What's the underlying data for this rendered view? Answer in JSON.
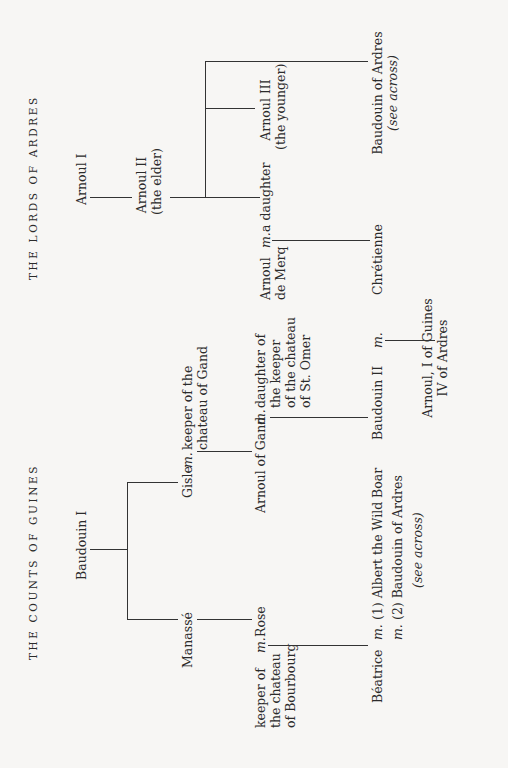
{
  "titles": {
    "lords": "THE LORDS OF ARDRES",
    "counts": "THE COUNTS OF GUINES"
  },
  "marriage_symbol": "m.",
  "lords_of_ardres": {
    "arnoul1": "Arnoul I",
    "arnoul2": {
      "name": "Arnoul II",
      "note": "(the elder)"
    },
    "arnoul3": {
      "name": "Arnoul III",
      "note": "(the younger)"
    },
    "baudouin_ardres": {
      "name": "Baudouin of Ardres",
      "note": "(see across)"
    },
    "a_daughter": "a daughter",
    "arnoul_merq": {
      "line1": "Arnoul",
      "line2": "de Merq"
    },
    "chretienne": "Chrétienne",
    "arnoul_guines": {
      "line1": "Arnoul, I of Guines",
      "line2": "IV of Ardres"
    }
  },
  "counts_of_guines": {
    "baudouin1": "Baudouin I",
    "gisle": "Gisle",
    "keeper_gand": {
      "line1": "keeper of the",
      "line2": "chateau of Gand"
    },
    "manasse": "Manassé",
    "rose": "Rose",
    "keeper_bourbourg": {
      "line1": "keeper of",
      "line2": "the chateau",
      "line3": "of Bourbourg"
    },
    "arnoul_gand": "Arnoul of Gand",
    "daughter_st_omer": {
      "line1": "daughter of",
      "line2": "the keeper",
      "line3": "of the chateau",
      "line4": "of St. Omer"
    },
    "baudouin2": "Baudouin II",
    "beatrice": "Béatrice",
    "marriage1": "(1) Albert the Wild Boar",
    "marriage2": "(2) Baudouin of Ardres",
    "marriage2_note": "(see across)"
  }
}
